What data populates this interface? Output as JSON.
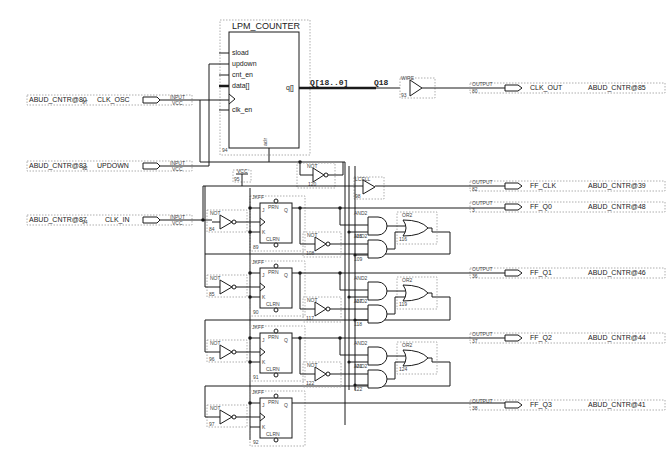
{
  "schematic": {
    "counter": {
      "title": "LPM_COUNTER",
      "ports": [
        "sload",
        "updown",
        "cnt_en",
        "data[]",
        "clk_en"
      ],
      "output_port": "q[]",
      "aclr_label": "aclr",
      "instance": "94"
    },
    "bus": {
      "name": "Q[18..0]",
      "tap": "Q18"
    },
    "wire_buffer": {
      "type": "WIRE",
      "instance": "93"
    },
    "lcell": {
      "type": "LCELL",
      "instance": "98"
    },
    "vcc": {
      "label": "VCC",
      "instance": "95"
    },
    "inputs": [
      {
        "pin": "ABUD_CNTR@80",
        "num": "97",
        "name": "CLK_OSC",
        "type": "INPUT",
        "default": "VCC"
      },
      {
        "pin": "ABUD_CNTR@83",
        "num": "92",
        "name": "UPDOWN",
        "type": "INPUT",
        "default": "VCC"
      },
      {
        "pin": "ABUD_CNTR@87",
        "num": "94",
        "name": "CLK_IN",
        "type": "INPUT",
        "default": "VCC"
      }
    ],
    "outputs": [
      {
        "name": "CLK_OUT",
        "pin": "ABUD_CNTR@85",
        "type": "OUTPUT",
        "num": "80"
      },
      {
        "name": "FF_CLK",
        "pin": "ABUD_CNTR@39",
        "type": "OUTPUT",
        "num": "82"
      },
      {
        "name": "FF_Q0",
        "pin": "ABUD_CNTR@48",
        "type": "OUTPUT",
        "num": "3"
      },
      {
        "name": "FF_Q1",
        "pin": "ABUD_CNTR@46",
        "type": "OUTPUT",
        "num": "36"
      },
      {
        "name": "FF_Q2",
        "pin": "ABUD_CNTR@44",
        "type": "OUTPUT",
        "num": "37"
      },
      {
        "name": "FF_Q3",
        "pin": "ABUD_CNTR@41",
        "type": "OUTPUT",
        "num": "38"
      }
    ],
    "flipflops": [
      {
        "type": "JKFF",
        "instance": "89",
        "j": "J",
        "k": "K",
        "q": "Q",
        "prn": "PRN",
        "clrn": "CLRN"
      },
      {
        "type": "JKFF",
        "instance": "90",
        "j": "J",
        "k": "K",
        "q": "Q",
        "prn": "PRN",
        "clrn": "CLRN"
      },
      {
        "type": "JKFF",
        "instance": "91",
        "j": "J",
        "k": "K",
        "q": "Q",
        "prn": "PRN",
        "clrn": "CLRN"
      },
      {
        "type": "JKFF",
        "instance": "92",
        "j": "J",
        "k": "K",
        "q": "Q",
        "prn": "PRN",
        "clrn": "CLRN"
      }
    ],
    "not_gates": [
      {
        "type": "NOT",
        "instance": "120"
      },
      {
        "type": "NOT",
        "instance": "84"
      },
      {
        "type": "NOT",
        "instance": "85"
      },
      {
        "type": "NOT",
        "instance": "96"
      },
      {
        "type": "NOT",
        "instance": "97"
      },
      {
        "type": "NOT",
        "instance": "108"
      },
      {
        "type": "NOT",
        "instance": "117"
      },
      {
        "type": "NOT",
        "instance": "122"
      }
    ],
    "and_gates": [
      {
        "type": "AND2",
        "instance": "115"
      },
      {
        "type": "AND2",
        "instance": "109"
      },
      {
        "type": "AND2",
        "instance": "117"
      },
      {
        "type": "AND2",
        "instance": "118"
      },
      {
        "type": "AND2",
        "instance": "121"
      },
      {
        "type": "AND2",
        "instance": "122"
      }
    ],
    "or_gates": [
      {
        "type": "OR2",
        "instance": "116"
      },
      {
        "type": "OR2",
        "instance": "119"
      },
      {
        "type": "OR2",
        "instance": "124"
      }
    ]
  }
}
